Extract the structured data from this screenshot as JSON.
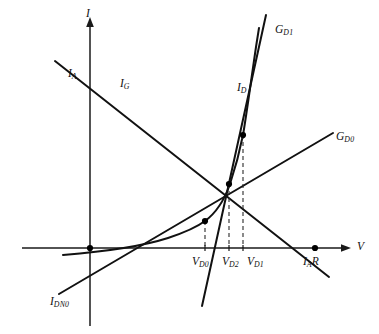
{
  "figure": {
    "type": "diagram",
    "domain": "semiconductor-device-graphical-analysis",
    "background_color": "#ffffff",
    "line_color": "#1a1a1a"
  },
  "axes": {
    "vertical": {
      "name": "current-axis",
      "label": "I",
      "label_html": "I",
      "arrow": "up",
      "x_px": 90,
      "y_top_px": 18,
      "y_bottom_px": 326
    },
    "horizontal": {
      "name": "voltage-axis",
      "label": "V",
      "label_html": "V",
      "arrow": "right",
      "y_px": 248,
      "x_left_px": 22,
      "x_right_px": 350
    }
  },
  "curves": [
    {
      "id": "i-g-load-line",
      "label": "I",
      "label_sub": "G",
      "label_html": "I<sub>G</sub>",
      "label_x": 120,
      "label_y": 78,
      "description": "generator load line, negative slope"
    },
    {
      "id": "g-d0-line",
      "label": "G",
      "label_sub": "D0",
      "label_html": "G<sub>D0</sub>",
      "label_x": 336,
      "label_y": 131,
      "description": "small-signal conductance line at operating point 0"
    },
    {
      "id": "g-d1-line",
      "label": "G",
      "label_sub": "D1",
      "label_html": "G<sub>D1</sub>",
      "label_x": 275,
      "label_y": 24,
      "description": "small-signal conductance line at operating point 1"
    },
    {
      "id": "i-d-diode-curve",
      "label": "I",
      "label_sub": "D",
      "label_html": "I<sub>D</sub>",
      "label_x": 237,
      "label_y": 82,
      "description": "diode characteristic exponential curve"
    }
  ],
  "intercept_labels": [
    {
      "id": "i-a-intercept",
      "label": "I",
      "label_sub": "A",
      "label_html": "I<sub>A</sub>",
      "label_x": 68,
      "label_y": 68,
      "description": "current axis intercept of I_G line"
    },
    {
      "id": "i-dn0-label",
      "label": "I",
      "label_sub": "DN0",
      "label_html": "I<sub>DN0</sub>",
      "label_x": 50,
      "label_y": 296,
      "description": "extrapolated negative-current intercept of G_D0 line"
    },
    {
      "id": "i-a-r-intercept",
      "label": "I",
      "label_sub": "A",
      "label_suffix": "R",
      "label_html": "I<sub>A</sub>R",
      "label_x": 303,
      "label_y": 256,
      "description": "voltage axis intercept of I_G line"
    }
  ],
  "voltage_ticks": [
    {
      "id": "v-d0-tick",
      "label": "V",
      "label_sub": "D0",
      "label_html": "V<sub>D0</sub>",
      "x_px": 205,
      "label_x": 192,
      "label_y": 256,
      "drop_from_y": 221
    },
    {
      "id": "v-d2-tick",
      "label": "V",
      "label_sub": "D2",
      "label_html": "V<sub>D2</sub>",
      "x_px": 229,
      "label_x": 224,
      "label_y": 256,
      "drop_from_y": 184
    },
    {
      "id": "v-d1-tick",
      "label": "V",
      "label_sub": "D1",
      "label_html": "V<sub>D1</sub>",
      "x_px": 243,
      "label_x": 245,
      "label_y": 256,
      "drop_from_y": 135
    }
  ],
  "operating_points": [
    {
      "id": "origin-point",
      "x_px": 90,
      "y_px": 248
    },
    {
      "id": "point-d0",
      "x_px": 205,
      "y_px": 221
    },
    {
      "id": "point-d2",
      "x_px": 229,
      "y_px": 184
    },
    {
      "id": "point-d1",
      "x_px": 243,
      "y_px": 135
    },
    {
      "id": "point-iar",
      "x_px": 315,
      "y_px": 248
    }
  ]
}
